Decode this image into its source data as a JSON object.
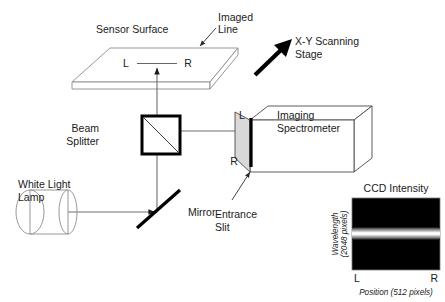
{
  "figure": {
    "background_color": "#ffffff"
  },
  "labels": {
    "sensor_surface": "Sensor Surface",
    "imaged_line": "Imaged\nLine",
    "imaged_line_l1": "Imaged",
    "imaged_line_l2": "Line",
    "xy_stage_l1": "X-Y Scanning",
    "xy_stage_l2": "Stage",
    "beam_splitter_l1": "Beam",
    "beam_splitter_l2": "Splitter",
    "imaging_spectrometer_l1": "Imaging",
    "imaging_spectrometer_l2": "Spectrometer",
    "white_light_lamp_l1": "White Light",
    "white_light_lamp_l2": "Lamp",
    "mirror": "Mirror",
    "entrance_slit_l1": "Entrance",
    "entrance_slit_l2": "Slit",
    "ccd_intensity": "CCD Intensity"
  },
  "markers": {
    "sensor_left": "L",
    "sensor_right": "R",
    "slit_top": "L",
    "slit_bottom": "R",
    "ccd_left": "L",
    "ccd_right": "R"
  },
  "ccd": {
    "title": "CCD Intensity",
    "y_axis_l1": "Wavelength",
    "y_axis_l2": "(2048 pixels)",
    "x_axis": "Position (512 pixels)",
    "x_left_tick": "L",
    "x_right_tick": "R",
    "detector_fill": "#000000",
    "band_core_color": "#ffffff",
    "band_fringe_color": "#a8a8a8",
    "wavelength_pixels": 2048,
    "position_pixels": 512
  },
  "colors": {
    "stroke_black": "#000000",
    "stroke_gray": "#8c8c8c",
    "beam_gray": "#6e6e6e",
    "spectrometer_front": "#d9d9d9",
    "text": "#1a1a1a"
  },
  "components": [
    {
      "name": "white-light-lamp",
      "type": "cylinder"
    },
    {
      "name": "mirror",
      "type": "thick-line-45deg"
    },
    {
      "name": "beam-splitter",
      "type": "square-with-diagonal"
    },
    {
      "name": "sensor-surface",
      "type": "3d-plate"
    },
    {
      "name": "imaging-spectrometer",
      "type": "3d-box"
    },
    {
      "name": "entrance-slit",
      "type": "vertical-bar"
    },
    {
      "name": "ccd-intensity-readout",
      "type": "image-panel"
    },
    {
      "name": "xy-scanning-stage-arrow",
      "type": "arrow"
    }
  ]
}
